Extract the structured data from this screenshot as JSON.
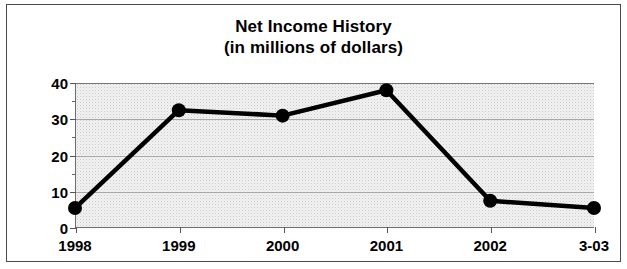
{
  "figure": {
    "title": "Net Income History",
    "subtitle": "(in millions of dollars)"
  },
  "chart_data": {
    "type": "line",
    "title": "Net Income History",
    "subtitle": "(in millions of dollars)",
    "xlabel": "",
    "ylabel": "",
    "categories": [
      "1998",
      "1999",
      "2000",
      "2001",
      "2002",
      "3-03"
    ],
    "values": [
      5.5,
      32.5,
      31,
      38,
      7.5,
      5.5
    ],
    "ylim": [
      0,
      40
    ],
    "yticks": [
      0,
      10,
      20,
      30,
      40
    ],
    "ytick_labels": [
      "0",
      "10",
      "20",
      "30",
      "40"
    ],
    "yminor_ticks": [
      5,
      15,
      25,
      35
    ],
    "grid": true,
    "grid_axis": "y",
    "legend": false,
    "marker": "circle",
    "line_color": "#000000",
    "marker_color": "#000000",
    "plot_background": "#f2f2f2"
  }
}
